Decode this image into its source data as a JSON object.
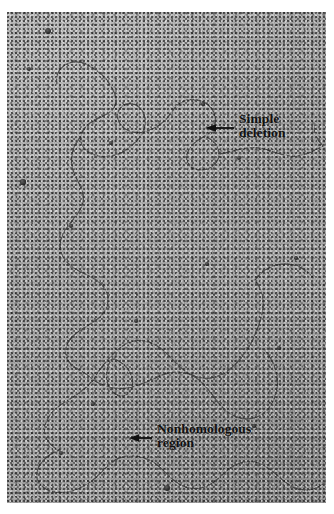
{
  "figure": {
    "kind": "electron-micrograph",
    "plate_background_color": "#a8a8a8",
    "filament_color": "#3b3b3b",
    "page_background_color": "#ffffff"
  },
  "annotations": [
    {
      "id": "simple-deletion",
      "arrow": "left-arrow-icon",
      "arrow_direction": "left",
      "lines": [
        "Simple",
        "deletion"
      ],
      "text_color": "#101010"
    },
    {
      "id": "nonhomologous-region",
      "arrow": "left-arrow-icon",
      "arrow_direction": "left",
      "lines": [
        "Nonhomologous",
        "region"
      ],
      "text_color": "#101010"
    }
  ],
  "specks": [
    {
      "x": 41,
      "y": 19,
      "r": 3.4
    },
    {
      "x": 22,
      "y": 57,
      "r": 2.0
    },
    {
      "x": 16,
      "y": 170,
      "r": 2.6
    },
    {
      "x": 64,
      "y": 214,
      "r": 2.2
    },
    {
      "x": 129,
      "y": 309,
      "r": 2.3
    },
    {
      "x": 196,
      "y": 92,
      "r": 1.8
    },
    {
      "x": 232,
      "y": 146,
      "r": 2.0
    },
    {
      "x": 160,
      "y": 476,
      "r": 3.2
    },
    {
      "x": 86,
      "y": 392,
      "r": 1.9
    },
    {
      "x": 272,
      "y": 336,
      "r": 1.8
    },
    {
      "x": 54,
      "y": 441,
      "r": 2.1
    },
    {
      "x": 247,
      "y": 414,
      "r": 1.7
    },
    {
      "x": 104,
      "y": 131,
      "r": 1.9
    },
    {
      "x": 289,
      "y": 246,
      "r": 1.7
    },
    {
      "x": 200,
      "y": 252,
      "r": 1.6
    }
  ],
  "filaments": [
    {
      "name": "upper-tangle-left",
      "d": "M 86 56 C 96 62, 104 72, 108 82 C 112 92, 106 100, 96 104 C 86 108, 76 114, 74 124 C 72 134, 80 142, 92 144 C 104 146, 116 142, 124 134"
    },
    {
      "name": "upper-tangle-loop",
      "d": "M 124 134 C 134 126, 140 116, 138 106 C 136 96, 128 90, 120 92 C 112 94, 108 102, 112 110 C 116 118, 126 122, 136 120 C 150 117, 160 108, 166 98"
    },
    {
      "name": "upper-tangle-right",
      "d": "M 166 98 C 172 90, 180 86, 190 88 C 200 90, 206 96, 208 104 C 210 112, 206 120, 198 124"
    },
    {
      "name": "deletion-loop-small",
      "d": "M 198 124 C 190 128, 182 134, 180 142 C 178 150, 184 158, 194 158 C 204 158, 212 150, 212 142 C 212 134, 206 128, 198 124"
    },
    {
      "name": "right-horizontal-run",
      "d": "M 212 142 C 226 140, 238 134, 252 136 C 266 138, 276 146, 290 144 C 300 143, 308 138, 316 134"
    },
    {
      "name": "left-descending-wavy",
      "d": "M 74 124 C 66 134, 62 146, 66 158 C 70 170, 78 178, 76 190 C 74 202, 62 210, 56 222 C 50 234, 54 246, 64 254 C 74 262, 88 264, 96 274 C 104 284, 102 296, 94 304"
    },
    {
      "name": "mid-diagonal",
      "d": "M 94 304 C 86 312, 74 316, 66 324 C 58 332, 56 342, 62 350 C 68 358, 80 360, 86 368"
    },
    {
      "name": "nonhomologous-bubble-upper",
      "d": "M 86 368 C 92 358, 100 348, 108 340 C 118 330, 130 326, 142 330 C 154 334, 162 344, 170 352 C 180 362, 192 368, 204 366 C 216 364, 226 356, 234 346 C 244 334, 250 320, 254 306 C 258 292, 256 278, 248 268"
    },
    {
      "name": "nonhomologous-bubble-lower",
      "d": "M 86 368 C 96 374, 108 378, 120 376 C 134 374, 146 366, 158 362 C 170 358, 182 360, 192 368 C 202 376, 208 388, 216 396 C 226 406, 240 410, 252 404 C 262 399, 268 388, 270 376 C 272 362, 266 348, 258 338"
    },
    {
      "name": "internal-small-loop",
      "d": "M 104 348 C 98 358, 98 370, 104 378 C 110 386, 120 386, 124 378 C 128 370, 124 358, 116 352 C 110 347, 105 346, 104 348 Z"
    },
    {
      "name": "lower-left-descend",
      "d": "M 86 368 C 78 378, 68 384, 58 390 C 48 396, 40 404, 38 414 C 36 424, 42 434, 52 438"
    },
    {
      "name": "bottom-left-loop",
      "d": "M 52 438 C 42 442, 32 450, 30 460 C 28 470, 36 478, 48 480 C 62 482, 76 476, 86 468 C 96 460, 102 450, 112 446"
    },
    {
      "name": "bottom-run-right",
      "d": "M 112 446 C 124 442, 136 444, 146 450 C 156 456, 162 466, 172 472 C 182 478, 194 478, 204 472 C 214 466, 220 456, 230 452 C 242 447, 254 450, 264 458"
    },
    {
      "name": "bottom-tail",
      "d": "M 264 458 C 272 464, 278 472, 288 476 C 298 480, 308 478, 316 472"
    },
    {
      "name": "right-edge-descend",
      "d": "M 248 268 C 256 258, 266 252, 278 252 C 290 252, 300 258, 306 266"
    },
    {
      "name": "upper-left-tail",
      "d": "M 86 56 C 78 50, 68 48, 60 52 C 52 56, 48 64, 50 72"
    },
    {
      "name": "far-right-upper-tail",
      "d": "M 316 134 C 310 128, 306 120, 308 112"
    }
  ]
}
